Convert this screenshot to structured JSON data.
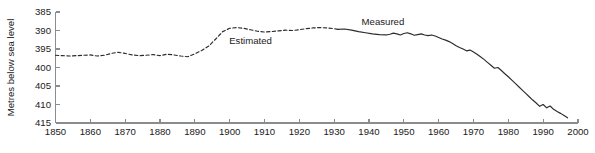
{
  "chart_data": {
    "type": "line",
    "title": "",
    "xlabel": "",
    "ylabel": "Metres below sea level",
    "xlim": [
      1850,
      2000
    ],
    "ylim": [
      415,
      385
    ],
    "y_inverted": true,
    "grid": false,
    "legend_position": "inline-annotations",
    "xticks": [
      1850,
      1860,
      1870,
      1880,
      1890,
      1900,
      1910,
      1920,
      1930,
      1940,
      1950,
      1960,
      1970,
      1980,
      1990,
      2000
    ],
    "yticks": [
      385,
      390,
      395,
      400,
      405,
      410,
      415
    ],
    "annotations": [
      {
        "text": "Estimated",
        "x": 1906,
        "y": 393.6
      },
      {
        "text": "Measured",
        "x": 1944,
        "y": 388.6
      }
    ],
    "series": [
      {
        "name": "Estimated",
        "style": "dashed",
        "color": "#2b2b2b",
        "x": [
          1850,
          1852,
          1854,
          1856,
          1858,
          1860,
          1862,
          1864,
          1866,
          1868,
          1870,
          1872,
          1874,
          1876,
          1878,
          1880,
          1882,
          1884,
          1886,
          1888,
          1890,
          1892,
          1894,
          1896,
          1898,
          1900,
          1902,
          1904,
          1906,
          1908,
          1910,
          1912,
          1914,
          1916,
          1918,
          1920,
          1922,
          1924,
          1926,
          1928,
          1930,
          1931
        ],
        "values": [
          396.7,
          396.8,
          396.9,
          396.8,
          396.7,
          396.6,
          396.9,
          396.7,
          396.2,
          395.9,
          396.2,
          396.6,
          396.8,
          396.7,
          396.5,
          396.8,
          396.4,
          396.6,
          396.9,
          397.1,
          396.3,
          395.4,
          394.2,
          392.3,
          390.3,
          389.4,
          389.2,
          389.4,
          389.8,
          390.2,
          390.4,
          390.3,
          390.1,
          389.9,
          390.0,
          389.8,
          389.5,
          389.3,
          389.2,
          389.3,
          389.5,
          389.7
        ]
      },
      {
        "name": "Measured",
        "style": "solid",
        "color": "#2b2b2b",
        "x": [
          1931,
          1933,
          1935,
          1937,
          1939,
          1941,
          1943,
          1945,
          1946,
          1947,
          1948,
          1949,
          1950,
          1951,
          1952,
          1953,
          1954,
          1955,
          1956,
          1957,
          1958,
          1959,
          1960,
          1961,
          1962,
          1963,
          1964,
          1965,
          1966,
          1967,
          1968,
          1969,
          1970,
          1971,
          1972,
          1973,
          1974,
          1975,
          1976,
          1977,
          1978,
          1979,
          1980,
          1981,
          1982,
          1983,
          1984,
          1985,
          1986,
          1987,
          1988,
          1989,
          1990,
          1991,
          1992,
          1993,
          1994,
          1995,
          1996,
          1997
        ],
        "values": [
          389.7,
          389.6,
          389.9,
          390.3,
          390.6,
          390.9,
          391.1,
          391.2,
          391.0,
          390.7,
          390.9,
          391.2,
          390.8,
          390.6,
          390.9,
          391.3,
          391.1,
          390.9,
          391.2,
          391.4,
          391.2,
          391.5,
          391.9,
          392.3,
          392.6,
          393.0,
          393.5,
          394.1,
          394.6,
          395.0,
          395.5,
          395.3,
          395.8,
          396.4,
          397.1,
          397.8,
          398.6,
          399.4,
          400.2,
          400.0,
          400.8,
          401.7,
          402.5,
          403.4,
          404.3,
          405.2,
          406.1,
          407.0,
          407.9,
          408.8,
          409.6,
          410.5,
          410.0,
          410.9,
          410.4,
          411.3,
          411.9,
          412.4,
          413.0,
          413.6
        ]
      }
    ]
  },
  "caption": {
    "text": ""
  }
}
